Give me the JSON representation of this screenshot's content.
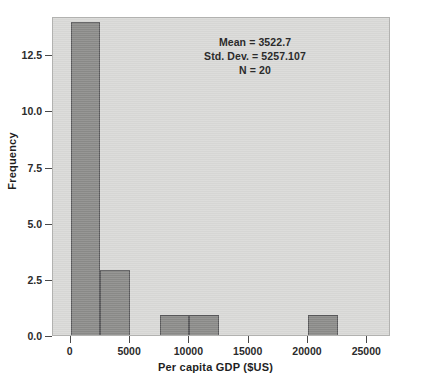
{
  "chart_data": {
    "type": "bar",
    "title": "",
    "subtitle": "",
    "xlabel": "Per capita GDP ($US)",
    "ylabel": "Frequency",
    "xlim": [
      -1500,
      27000
    ],
    "ylim": [
      0,
      14.2
    ],
    "xticks": [
      0,
      5000,
      10000,
      15000,
      20000,
      25000
    ],
    "xtick_labels": [
      "0",
      "5000",
      "10000",
      "15000",
      "20000",
      "25000"
    ],
    "yticks": [
      0.0,
      2.5,
      5.0,
      7.5,
      10.0,
      12.5
    ],
    "ytick_labels": [
      "0.0",
      "2.5",
      "5.0",
      "7.5",
      "10.0",
      "12.5"
    ],
    "grid": false,
    "legend": null,
    "bin_width": 2500,
    "bins": [
      {
        "x0": 0,
        "x1": 2500,
        "value": 14
      },
      {
        "x0": 2500,
        "x1": 5000,
        "value": 3
      },
      {
        "x0": 7500,
        "x1": 10000,
        "value": 1
      },
      {
        "x0": 10000,
        "x1": 12500,
        "value": 1
      },
      {
        "x0": 20000,
        "x1": 22500,
        "value": 1
      }
    ],
    "annotations": [
      "Mean = 3522.7",
      "Std. Dev. = 5257.107",
      "N = 20"
    ],
    "colors": {
      "bar_fill": "#8b8b89",
      "bar_edge": "#58585a",
      "plot_background": "#d9d9d7",
      "figure_background": "#ffffff",
      "text": "#1f1f1f"
    },
    "statistics": {
      "mean": 3522.7,
      "std_dev": 5257.107,
      "n": 20
    }
  }
}
